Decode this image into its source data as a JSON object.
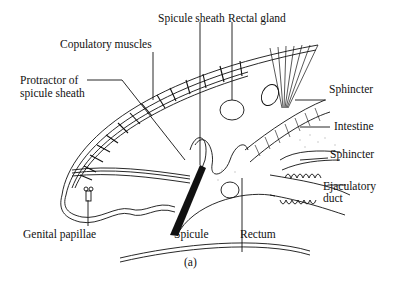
{
  "figure": {
    "caption": "(a)",
    "labels": {
      "spicule_sheath": "Spicule sheath",
      "rectal_gland": "Rectal gland",
      "copulatory_muscles": "Copulatory muscles",
      "protractor_line1": "Protractor of",
      "protractor_line2": "spicule sheath",
      "sphincter_upper": "Sphincter",
      "intestine": "Intestine",
      "sphincter_lower": "Sphincter",
      "ejaculatory_line1": "Ejaculatory",
      "ejaculatory_line2": "duct",
      "genital_papillae": "Genital papillae",
      "spicule": "Spicule",
      "rectum": "Rectum"
    }
  },
  "colors": {
    "ink": "#111111",
    "stipple": "#bbbbbb",
    "background": "#ffffff"
  }
}
